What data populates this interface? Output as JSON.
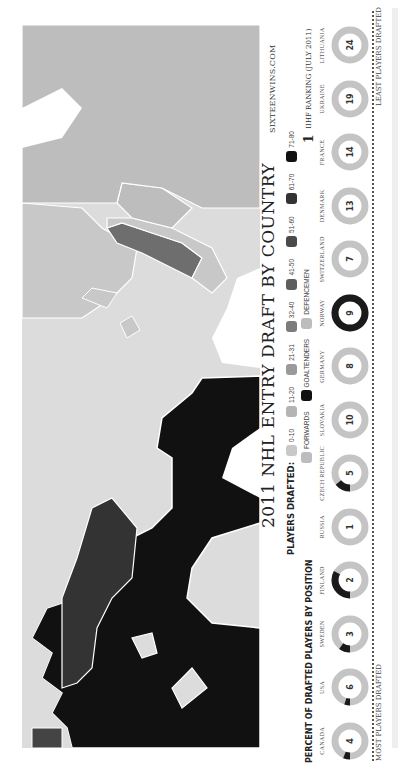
{
  "title": "2011 NHL ENTRY DRAFT BY COUNTRY",
  "credit": "SIXTEENWINS.COM",
  "legend": {
    "label": "PLAYERS DRAFTED:",
    "bins": [
      {
        "range": "0-10",
        "color": "#c8c8c8"
      },
      {
        "range": "11-20",
        "color": "#b4b4b4"
      },
      {
        "range": "21-31",
        "color": "#9a9a9a"
      },
      {
        "range": "32-40",
        "color": "#7c7c7c"
      },
      {
        "range": "41-50",
        "color": "#5e5e5e"
      },
      {
        "range": "51-60",
        "color": "#4a4a4a"
      },
      {
        "range": "61-70",
        "color": "#333333"
      },
      {
        "range": "71-80",
        "color": "#111111"
      }
    ]
  },
  "position_legend": {
    "label": "PERCENT OF DRAFTED PLAYERS BY POSITION",
    "items": [
      {
        "name": "FORWARDS",
        "color": "#bdbdbd"
      },
      {
        "name": "GOALTENDERS",
        "color": "#111111"
      },
      {
        "name": "DEFENCEMEN",
        "color": "#bdbdbd"
      }
    ]
  },
  "ranking_note": {
    "symbol": "1",
    "text": "IIHF RANKING (JULY 2011)"
  },
  "axis": {
    "left": "MOST PLAYERS DRAFTED",
    "right": "LEAST PLAYERS DRAFTED"
  },
  "chart_data": {
    "type": "donut-table",
    "title": "2011 NHL ENTRY DRAFT BY COUNTRY",
    "subtitle": "PERCENT OF DRAFTED PLAYERS BY POSITION",
    "ordering": "left = most players drafted, right = least players drafted",
    "categories": [
      "CANADA",
      "USA",
      "SWEDEN",
      "FINLAND",
      "RUSSIA",
      "CZECH REPUBLIC",
      "SLOVAKIA",
      "GERMANY",
      "NORWAY",
      "SWITZERLAND",
      "DENMARK",
      "FRANCE",
      "UKRAINE",
      "LITHUANIA"
    ],
    "iihf_ranking": [
      4,
      6,
      3,
      2,
      1,
      5,
      10,
      8,
      9,
      7,
      13,
      14,
      19,
      24
    ],
    "goaltender_share_pct": [
      6,
      5,
      10,
      33,
      0,
      14,
      0,
      0,
      100,
      0,
      0,
      0,
      0,
      0
    ],
    "players_drafted_bins": [
      "0-10",
      "11-20",
      "21-31",
      "32-40",
      "41-50",
      "51-60",
      "61-70",
      "71-80"
    ]
  },
  "countries": [
    {
      "name": "CANADA",
      "rank": "4",
      "dark_pct": 6
    },
    {
      "name": "USA",
      "rank": "6",
      "dark_pct": 5
    },
    {
      "name": "SWEDEN",
      "rank": "3",
      "dark_pct": 10
    },
    {
      "name": "FINLAND",
      "rank": "2",
      "dark_pct": 33
    },
    {
      "name": "RUSSIA",
      "rank": "1",
      "dark_pct": 0
    },
    {
      "name": "CZECH REPUBLIC",
      "rank": "5",
      "dark_pct": 14
    },
    {
      "name": "SLOVAKIA",
      "rank": "10",
      "dark_pct": 0
    },
    {
      "name": "GERMANY",
      "rank": "8",
      "dark_pct": 0
    },
    {
      "name": "NORWAY",
      "rank": "9",
      "dark_pct": 100
    },
    {
      "name": "SWITZERLAND",
      "rank": "7",
      "dark_pct": 0
    },
    {
      "name": "DENMARK",
      "rank": "13",
      "dark_pct": 0
    },
    {
      "name": "FRANCE",
      "rank": "14",
      "dark_pct": 0
    },
    {
      "name": "UKRAINE",
      "rank": "19",
      "dark_pct": 0
    },
    {
      "name": "LITHUANIA",
      "rank": "24",
      "dark_pct": 0
    }
  ],
  "colors": {
    "ocean": "#dcdcdc",
    "land_light": "#c8c8c8",
    "land_russia": "#bdbdbd",
    "canada": "#111111",
    "usa": "#333333",
    "sweden": "#6e6e6e",
    "donut_ring": "#c4c4c4",
    "donut_dark": "#1a1a1a"
  }
}
